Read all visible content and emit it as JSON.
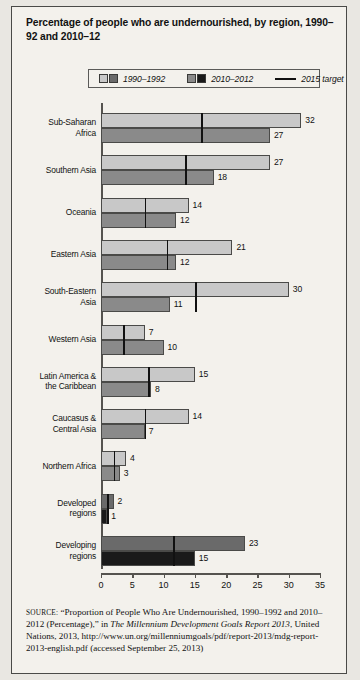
{
  "title": "Percentage of people who are undernourished, by region, 1990–92 and 2010–12",
  "legend": [
    {
      "label": "1990–1992",
      "type": "swatch-pair",
      "light": "#c8c8c8",
      "dark": "#6a6a6a"
    },
    {
      "label": "2010–2012",
      "type": "swatch-pair",
      "light": "#8a8a8a",
      "dark": "#1a1a1a"
    },
    {
      "label": "2015 target",
      "type": "line",
      "color": "#111111"
    }
  ],
  "source": {
    "prefix": "SOURCE:",
    "part1": " “Proportion of People Who Are Undernourished, 1990–1992 and 2010–2012 (Percentage),” in ",
    "italic": "The Millennium Development Goals Report 2013",
    "part2": ", United Nations, 2013, http://www.un.org/millenniumgoals/pdf/report-2013/mdg-report-2013-english.pdf (accessed September 25, 2013)"
  },
  "chart_data": {
    "type": "bar",
    "orientation": "horizontal",
    "title": "Percentage of people who are undernourished, by region, 1990–92 and 2010–12",
    "xlabel": "",
    "ylabel": "",
    "xlim": [
      0,
      35
    ],
    "xticks": [
      0,
      5,
      10,
      15,
      20,
      25,
      30,
      35
    ],
    "grid": false,
    "legend_position": "top",
    "categories": [
      "Sub-Saharan Africa",
      "Southern Asia",
      "Oceania",
      "Eastern Asia",
      "South-Eastern Asia",
      "Western Asia",
      "Latin America & the Caribbean",
      "Caucasus & Central Asia",
      "Northern Africa",
      "Developed regions",
      "Developing regions"
    ],
    "series": [
      {
        "name": "1990–1992",
        "values": [
          32,
          27,
          14,
          21,
          30,
          7,
          15,
          14,
          4,
          2,
          23
        ]
      },
      {
        "name": "2010–2012",
        "values": [
          27,
          18,
          12,
          12,
          11,
          10,
          8,
          7,
          3,
          1,
          15
        ]
      },
      {
        "name": "2015 target",
        "values": [
          16,
          13.5,
          7,
          10.5,
          15,
          3.5,
          7.5,
          7,
          2,
          1,
          11.5
        ]
      }
    ],
    "rows": [
      {
        "label_line1": "Sub-Saharan",
        "label_line2": "Africa",
        "v1990": 32,
        "v2010": 27,
        "target": 16,
        "aggregate": false
      },
      {
        "label_line1": "Southern Asia",
        "label_line2": "",
        "v1990": 27,
        "v2010": 18,
        "target": 13.5,
        "aggregate": false
      },
      {
        "label_line1": "Oceania",
        "label_line2": "",
        "v1990": 14,
        "v2010": 12,
        "target": 7,
        "aggregate": false
      },
      {
        "label_line1": "Eastern Asia",
        "label_line2": "",
        "v1990": 21,
        "v2010": 12,
        "target": 10.5,
        "aggregate": false
      },
      {
        "label_line1": "South-Eastern",
        "label_line2": "Asia",
        "v1990": 30,
        "v2010": 11,
        "target": 15,
        "aggregate": false
      },
      {
        "label_line1": "Western Asia",
        "label_line2": "",
        "v1990": 7,
        "v2010": 10,
        "target": 3.5,
        "aggregate": false
      },
      {
        "label_line1": "Latin America &",
        "label_line2": "the Caribbean",
        "v1990": 15,
        "v2010": 8,
        "target": 7.5,
        "aggregate": false
      },
      {
        "label_line1": "Caucasus &",
        "label_line2": "Central Asia",
        "v1990": 14,
        "v2010": 7,
        "target": 7,
        "aggregate": false
      },
      {
        "label_line1": "Northern Africa",
        "label_line2": "",
        "v1990": 4,
        "v2010": 3,
        "target": 2,
        "aggregate": false
      },
      {
        "label_line1": "Developed",
        "label_line2": "regions",
        "v1990": 2,
        "v2010": 1,
        "target": 1,
        "aggregate": true
      },
      {
        "label_line1": "Developing",
        "label_line2": "regions",
        "v1990": 23,
        "v2010": 15,
        "target": 11.5,
        "aggregate": true
      }
    ]
  }
}
